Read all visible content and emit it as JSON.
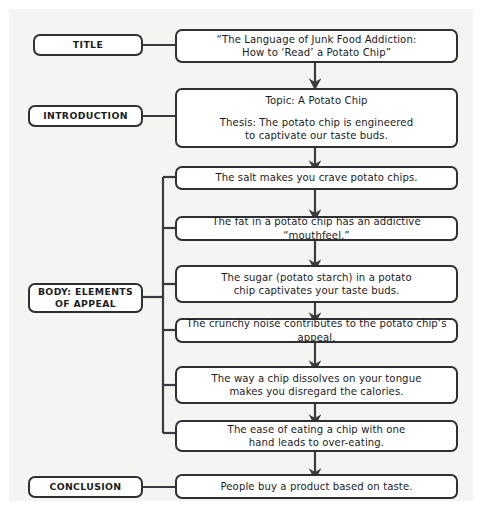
{
  "diagram": {
    "type": "flowchart",
    "colors": {
      "background": "#ffffff",
      "panel": "#f4f4f2",
      "box_fill": "#ffffff",
      "box_border": "#2f3033",
      "connector": "#3a3b3e",
      "text": "#1b1c1e"
    },
    "sections": [
      {
        "id": "title",
        "label": "TITLE",
        "content_lines": [
          "“The Language of Junk Food Addiction:",
          "How to ‘Read’ a Potato Chip”"
        ]
      },
      {
        "id": "introduction",
        "label": "INTRODUCTION",
        "content_lines": [
          "Topic: A Potato Chip",
          "",
          "Thesis: The potato chip is engineered",
          "to captivate our taste buds."
        ]
      },
      {
        "id": "body",
        "label_lines": [
          "BODY: ELEMENTS",
          "OF APPEAL"
        ],
        "label": "BODY: ELEMENTS OF APPEAL"
      },
      {
        "id": "conclusion",
        "label": "CONCLUSION",
        "content_lines": [
          "People buy a product based on taste."
        ]
      }
    ],
    "body_items": [
      {
        "id": "body-1",
        "lines": [
          "The salt makes you crave potato chips."
        ]
      },
      {
        "id": "body-2",
        "lines": [
          "The fat in a potato chip has an addictive “mouthfeel.”"
        ]
      },
      {
        "id": "body-3",
        "lines": [
          "The sugar (potato starch) in a potato",
          "chip captivates your taste buds."
        ]
      },
      {
        "id": "body-4",
        "lines": [
          "The crunchy noise contributes to the potato chip’s appeal."
        ]
      },
      {
        "id": "body-5",
        "lines": [
          "The way a chip dissolves on your tongue",
          "makes you disregard the calories."
        ]
      },
      {
        "id": "body-6",
        "lines": [
          "The ease of eating a chip with one",
          "hand leads to over-eating."
        ]
      }
    ]
  }
}
